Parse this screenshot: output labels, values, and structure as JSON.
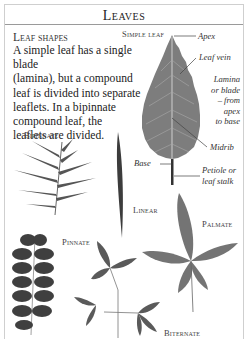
{
  "header": {
    "title": "Leaves"
  },
  "intro": {
    "heading": "Leaf shapes",
    "lines": [
      "A simple leaf has a single blade",
      "(lamina), but a compound",
      "leaf is divided into separate",
      "leaflets. In a bipinnate",
      "compound leaf, the",
      "leaflets are divided."
    ]
  },
  "simple_leaf": {
    "label": "Simple leaf",
    "annotations": {
      "apex": "Apex",
      "leaf_vein": "Leaf vein",
      "lamina_1": "Lamina",
      "lamina_2": "or blade",
      "lamina_3": "– from",
      "lamina_4": "apex",
      "lamina_5": "to base",
      "midrib": "Midrib",
      "base": "Base",
      "petiole_1": "Petiole or",
      "petiole_2": "leaf stalk"
    }
  },
  "leaf_types": {
    "bipinnate": "Bipinnate",
    "linear": "Linear",
    "palmate": "Palmate",
    "pinnate": "Pinnate",
    "biternate": "Biternate"
  },
  "colors": {
    "leaf_gray": "#7a7a7a",
    "leaf_dark": "#4a4a4a",
    "rule": "#9a9a9a"
  }
}
